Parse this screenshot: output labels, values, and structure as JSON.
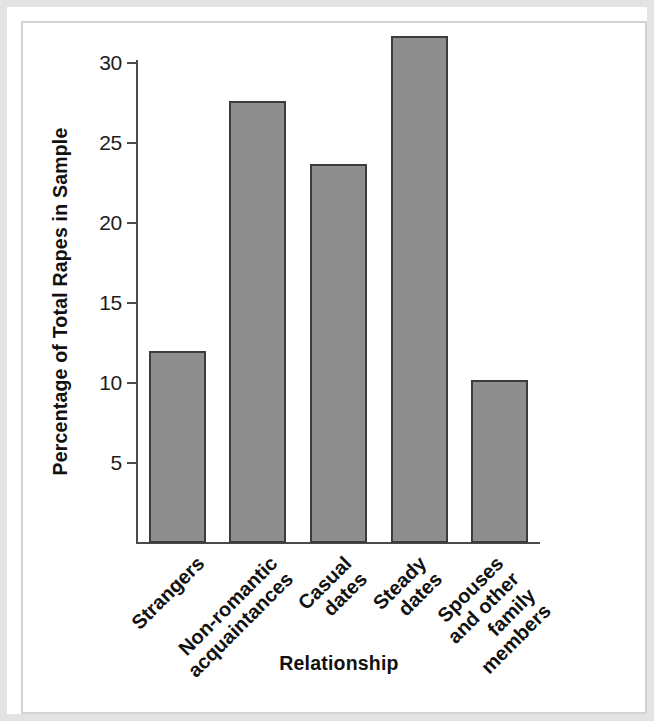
{
  "figure": {
    "background_color": "#ffffff",
    "frame_color": "#e3e3e3",
    "axis_color": "#4a4a4a",
    "bar_fill_color": "#8e8e8e",
    "bar_border_color": "#3c3c3c"
  },
  "chart_data": {
    "type": "bar",
    "title": "",
    "xlabel": "Relationship",
    "ylabel": "Percentage of Total Rapes in Sample",
    "categories": [
      "Strangers",
      "Non-romantic acquaintances",
      "Casual dates",
      "Steady dates",
      "Spouses and other family members"
    ],
    "category_lines": [
      [
        "Strangers"
      ],
      [
        "Non-romantic",
        "acquaintances"
      ],
      [
        "Casual",
        "dates"
      ],
      [
        "Steady",
        "dates"
      ],
      [
        "Spouses",
        "and other",
        "family",
        "members"
      ]
    ],
    "values": [
      12.0,
      27.6,
      23.7,
      31.7,
      10.2
    ],
    "ylim": [
      0,
      32.5
    ],
    "yticks": [
      5,
      10,
      15,
      20,
      25,
      30
    ],
    "ytick_labels": [
      "5",
      "10",
      "15",
      "20",
      "25",
      "30"
    ],
    "grid": false,
    "legend": null,
    "series": [
      {
        "name": "Percentage of Total Rapes in Sample",
        "values": [
          12.0,
          27.6,
          23.7,
          31.7,
          10.2
        ]
      }
    ]
  }
}
